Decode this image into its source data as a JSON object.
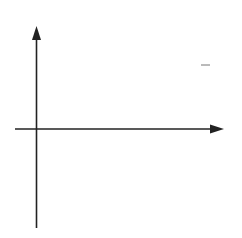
{
  "chart_data": {
    "type": "line",
    "title": "",
    "xlabel": "x",
    "ylabel": "y",
    "xlim": [
      -2,
      18
    ],
    "ylim": [
      -9.5,
      10
    ],
    "grid": true,
    "x_ticks": [
      5,
      10,
      15
    ],
    "y_ticks": [
      5,
      -5
    ],
    "x_tick_labels": [
      "5",
      "10",
      "15"
    ],
    "y_tick_labels": [
      "5",
      "-5"
    ],
    "annotation": "f(x) = √x",
    "series": [
      {
        "name": "f(x) = √x",
        "color": "#6b6b6b",
        "x": [
          0,
          0.25,
          1,
          2,
          4,
          6,
          9,
          12,
          16,
          17.5
        ],
        "y": [
          0,
          0.5,
          1,
          1.414,
          2,
          2.449,
          3,
          3.464,
          4,
          4.183
        ]
      }
    ]
  },
  "labels": {
    "x_axis": "x",
    "y_axis": "y",
    "x5": "5",
    "x10": "10",
    "x15": "15",
    "y5": "5",
    "yneg5": "−5",
    "fn_f": "f",
    "fn_paren": "(x) = ",
    "fn_sqrt": "√",
    "fn_x": "x"
  },
  "colors": {
    "grid": "#c8c8c8",
    "axis": "#222222",
    "curve": "#6b6b6b"
  }
}
